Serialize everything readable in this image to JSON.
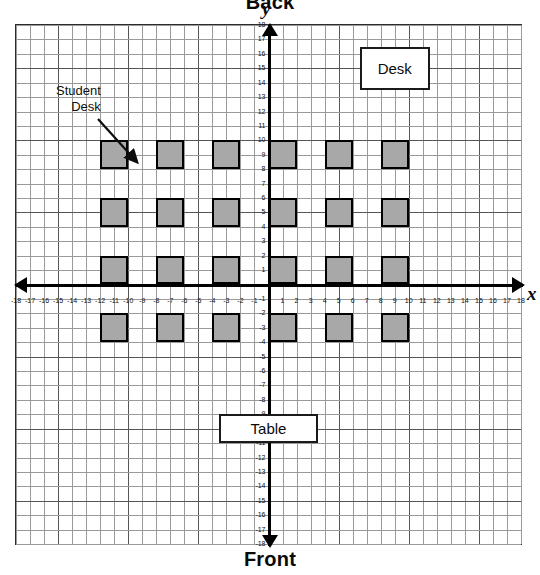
{
  "title_labels": {
    "back": "Back",
    "front": "Front",
    "y_axis_letter": "y",
    "x_axis_letter": "x"
  },
  "annotation": {
    "line1": "Student",
    "line2": "Desk",
    "pointer_icon": "arrow-down-right-icon"
  },
  "furniture": [
    {
      "name": "teacher-desk",
      "label": "Desk",
      "x": 9,
      "y": 15,
      "w": 5,
      "h": 3
    },
    {
      "name": "table",
      "label": "Table",
      "x": 0,
      "y": -10,
      "w": 7,
      "h": 2
    }
  ],
  "colors": {
    "desk_fill": "#a8a8a8",
    "desk_border": "#000000",
    "grid_minor": "#9a9a9a",
    "grid_major": "#555555",
    "axis": "#000000",
    "panel_border": "#2b2b2b",
    "background": "#ffffff"
  },
  "chart_data": {
    "type": "scatter",
    "xlabel": "x",
    "ylabel": "y",
    "xlim": [
      -18,
      18
    ],
    "ylim": [
      -18,
      18
    ],
    "grid": true,
    "legend": false,
    "x_ticks": [
      -18,
      -17,
      -16,
      -15,
      -14,
      -13,
      -12,
      -11,
      -10,
      -9,
      -8,
      -7,
      -6,
      -5,
      -4,
      -3,
      -2,
      -1,
      1,
      2,
      3,
      4,
      5,
      6,
      7,
      8,
      9,
      10,
      11,
      12,
      13,
      14,
      15,
      16,
      17,
      18
    ],
    "y_ticks": [
      18,
      17,
      16,
      15,
      14,
      13,
      12,
      11,
      10,
      9,
      8,
      7,
      6,
      5,
      4,
      3,
      2,
      1,
      -1,
      -2,
      -3,
      -4,
      -5,
      -6,
      -7,
      -8,
      -9,
      -10,
      -11,
      -12,
      -13,
      -14,
      -15,
      -16,
      -17,
      -18
    ],
    "annotations": [
      "Back",
      "Front",
      "Student Desk",
      "Desk",
      "Table"
    ],
    "student_desks": [
      {
        "id": "desk-r1-c1",
        "x_left": -12,
        "x_right": -10,
        "y_bottom": 8,
        "y_top": 10
      },
      {
        "id": "desk-r1-c2",
        "x_left": -8,
        "x_right": -6,
        "y_bottom": 8,
        "y_top": 10
      },
      {
        "id": "desk-r1-c3",
        "x_left": -4,
        "x_right": -2,
        "y_bottom": 8,
        "y_top": 10
      },
      {
        "id": "desk-r1-c4",
        "x_left": 0,
        "x_right": 2,
        "y_bottom": 8,
        "y_top": 10
      },
      {
        "id": "desk-r1-c5",
        "x_left": 4,
        "x_right": 6,
        "y_bottom": 8,
        "y_top": 10
      },
      {
        "id": "desk-r1-c6",
        "x_left": 8,
        "x_right": 10,
        "y_bottom": 8,
        "y_top": 10
      },
      {
        "id": "desk-r2-c1",
        "x_left": -12,
        "x_right": -10,
        "y_bottom": 4,
        "y_top": 6
      },
      {
        "id": "desk-r2-c2",
        "x_left": -8,
        "x_right": -6,
        "y_bottom": 4,
        "y_top": 6
      },
      {
        "id": "desk-r2-c3",
        "x_left": -4,
        "x_right": -2,
        "y_bottom": 4,
        "y_top": 6
      },
      {
        "id": "desk-r2-c4",
        "x_left": 0,
        "x_right": 2,
        "y_bottom": 4,
        "y_top": 6
      },
      {
        "id": "desk-r2-c5",
        "x_left": 4,
        "x_right": 6,
        "y_bottom": 4,
        "y_top": 6
      },
      {
        "id": "desk-r2-c6",
        "x_left": 8,
        "x_right": 10,
        "y_bottom": 4,
        "y_top": 6
      },
      {
        "id": "desk-r3-c1",
        "x_left": -12,
        "x_right": -10,
        "y_bottom": 0,
        "y_top": 2
      },
      {
        "id": "desk-r3-c2",
        "x_left": -8,
        "x_right": -6,
        "y_bottom": 0,
        "y_top": 2
      },
      {
        "id": "desk-r3-c3",
        "x_left": -4,
        "x_right": -2,
        "y_bottom": 0,
        "y_top": 2
      },
      {
        "id": "desk-r3-c4",
        "x_left": 0,
        "x_right": 2,
        "y_bottom": 0,
        "y_top": 2
      },
      {
        "id": "desk-r3-c5",
        "x_left": 4,
        "x_right": 6,
        "y_bottom": 0,
        "y_top": 2
      },
      {
        "id": "desk-r3-c6",
        "x_left": 8,
        "x_right": 10,
        "y_bottom": 0,
        "y_top": 2
      },
      {
        "id": "desk-r4-c1",
        "x_left": -12,
        "x_right": -10,
        "y_bottom": -4,
        "y_top": -2
      },
      {
        "id": "desk-r4-c2",
        "x_left": -8,
        "x_right": -6,
        "y_bottom": -4,
        "y_top": -2
      },
      {
        "id": "desk-r4-c3",
        "x_left": -4,
        "x_right": -2,
        "y_bottom": -4,
        "y_top": -2
      },
      {
        "id": "desk-r4-c4",
        "x_left": 0,
        "x_right": 2,
        "y_bottom": -4,
        "y_top": -2
      },
      {
        "id": "desk-r4-c5",
        "x_left": 4,
        "x_right": 6,
        "y_bottom": -4,
        "y_top": -2
      },
      {
        "id": "desk-r4-c6",
        "x_left": 8,
        "x_right": 10,
        "y_bottom": -4,
        "y_top": -2
      }
    ]
  }
}
